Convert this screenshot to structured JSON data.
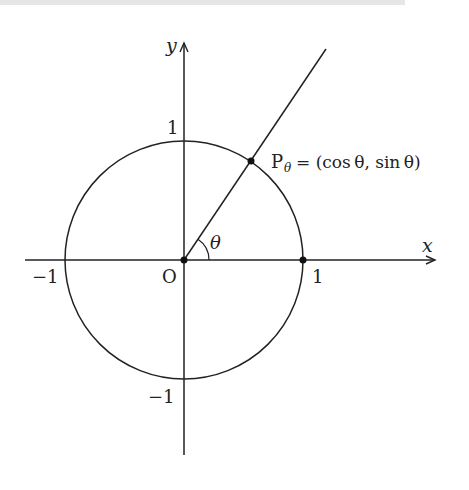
{
  "figure": {
    "axes": {
      "x_label": "x",
      "y_label": "y",
      "origin_label": "O"
    },
    "ticks": {
      "x_pos": "1",
      "x_neg": "−1",
      "y_pos": "1",
      "y_neg": "−1"
    },
    "angle_label": "θ",
    "point": {
      "name": "P",
      "subscript": "θ",
      "equals": "= (cos θ, sin θ)"
    },
    "colors": {
      "stroke": "#222222",
      "background": "#ffffff"
    },
    "geometry": {
      "angle_degrees": 56,
      "radius_px": 119
    }
  }
}
